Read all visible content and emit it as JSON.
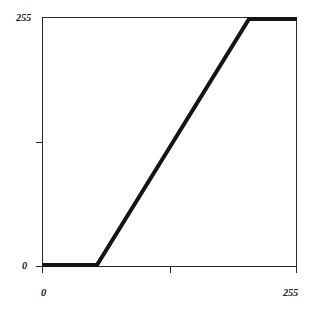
{
  "chart_data": {
    "type": "line",
    "title": "",
    "subtitle": "",
    "xlabel": "",
    "ylabel": "",
    "xlim": [
      0,
      255
    ],
    "ylim": [
      0,
      255
    ],
    "grid": false,
    "legend": null,
    "xticks": [
      0,
      128,
      255
    ],
    "yticks": [
      0,
      128,
      255
    ],
    "xticklabels": [
      "0",
      "",
      "255"
    ],
    "yticklabels": [
      "0",
      "",
      "255"
    ],
    "annotations": [],
    "series": [
      {
        "name": "tone curve",
        "x": [
          0,
          55,
          207,
          255
        ],
        "values": [
          0,
          0,
          255,
          255
        ],
        "color": "#141414",
        "linewidth": 4
      }
    ]
  },
  "axes": {
    "y_max_label": "255",
    "y_min_label": "0",
    "x_min_label": "0",
    "x_max_label": "255"
  },
  "colors": {
    "background": "#ffffff",
    "frame": "#262626",
    "curve": "#141414",
    "text": "#1a1a1a"
  }
}
